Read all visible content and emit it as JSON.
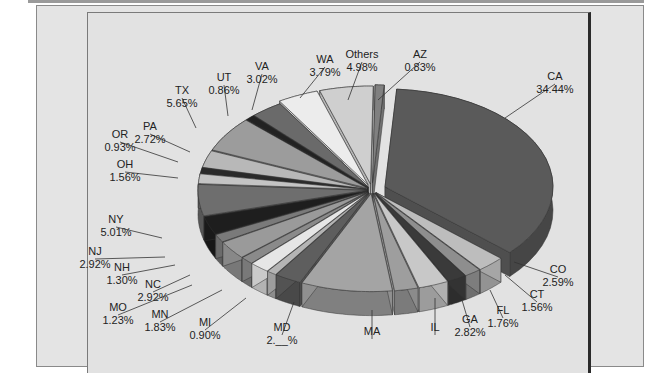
{
  "chart_data": {
    "type": "pie",
    "style": "3d-exploded",
    "title": "",
    "slices": [
      {
        "label": "CA",
        "value": 34.44,
        "color": "#5a5a5a"
      },
      {
        "label": "CO",
        "value": 2.59,
        "color": "#bdbdbd"
      },
      {
        "label": "CT",
        "value": 1.56,
        "color": "#8e8e8e"
      },
      {
        "label": "FL",
        "value": 1.76,
        "color": "#3a3a3a"
      },
      {
        "label": "GA",
        "value": 2.82,
        "color": "#c8c8c8"
      },
      {
        "label": "IL",
        "value": null,
        "color": "#9e9e9e"
      },
      {
        "label": "MA",
        "value": null,
        "color": "#a4a4a4"
      },
      {
        "label": "MD",
        "value": null,
        "color": "#5e5e5e"
      },
      {
        "label": "MI",
        "value": 0.9,
        "color": "#b4b4b4"
      },
      {
        "label": "MN",
        "value": 1.83,
        "color": "#e6e6e6"
      },
      {
        "label": "MO",
        "value": 1.23,
        "color": "#8a8a8a"
      },
      {
        "label": "NC",
        "value": 2.92,
        "color": "#9a9a9a"
      },
      {
        "label": "NH",
        "value": 1.3,
        "color": "#7a7a7a"
      },
      {
        "label": "NJ",
        "value": 2.92,
        "color": "#1e1e1e"
      },
      {
        "label": "NY",
        "value": 5.01,
        "color": "#6e6e6e"
      },
      {
        "label": "OH",
        "value": 1.56,
        "color": "#c4c4c4"
      },
      {
        "label": "OR",
        "value": 0.93,
        "color": "#2a2a2a"
      },
      {
        "label": "PA",
        "value": 2.72,
        "color": "#b8b8b8"
      },
      {
        "label": "TX",
        "value": 5.65,
        "color": "#9c9c9c"
      },
      {
        "label": "UT",
        "value": 0.86,
        "color": "#222222"
      },
      {
        "label": "VA",
        "value": 3.02,
        "color": "#6a6a6a"
      },
      {
        "label": "WA",
        "value": 3.79,
        "color": "#ececec"
      },
      {
        "label": "Others",
        "value": 4.98,
        "color": "#cfcfcf"
      },
      {
        "label": "AZ",
        "value": 0.83,
        "color": "#808080"
      }
    ]
  },
  "labels": {
    "CA": [
      "CA",
      "34.44%"
    ],
    "CO": [
      "CO",
      "2.59%"
    ],
    "CT": [
      "CT",
      "1.56%"
    ],
    "FL": [
      "FL",
      "1.76%"
    ],
    "GA": [
      "GA",
      "2.82%"
    ],
    "IL": [
      "IL",
      ""
    ],
    "MA": [
      "MA",
      ""
    ],
    "MD": [
      "MD",
      "2.__%"
    ],
    "MI": [
      "MI",
      "0.90%"
    ],
    "MN": [
      "MN",
      "1.83%"
    ],
    "MO": [
      "MO",
      "1.23%"
    ],
    "NC": [
      "NC",
      "2.92%"
    ],
    "NH": [
      "NH",
      "1.30%"
    ],
    "NJ": [
      "NJ",
      "2.92%"
    ],
    "NY": [
      "NY",
      "5.01%"
    ],
    "OH": [
      "OH",
      "1.56%"
    ],
    "OR": [
      "OR",
      "0.93%"
    ],
    "PA": [
      "PA",
      "2.72%"
    ],
    "TX": [
      "TX",
      "5.65%"
    ],
    "UT": [
      "UT",
      "0.86%"
    ],
    "VA": [
      "VA",
      "3.02%"
    ],
    "WA": [
      "WA",
      "3.79%"
    ],
    "Others": [
      "Others",
      "4.98%"
    ],
    "AZ": [
      "AZ",
      "0.83%"
    ]
  }
}
